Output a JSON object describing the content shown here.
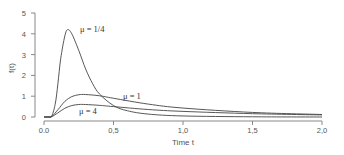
{
  "chart_data": {
    "type": "line",
    "title": "",
    "xlabel": "Time t",
    "ylabel": "f(t)",
    "xlim": [
      0,
      2
    ],
    "ylim": [
      0,
      5
    ],
    "xticks": [
      "0.0",
      "0.5",
      "1.0",
      "1.5",
      "2.0"
    ],
    "xtick_labels": [
      "0.0",
      "0,5",
      "1,0",
      "1,5",
      "2,0"
    ],
    "yticks": [
      "0",
      "1",
      "2",
      "3",
      "4",
      "5"
    ],
    "grid": false,
    "legend": "none (inline annotations)",
    "series": [
      {
        "name": "μ = 1/4",
        "x": [
          0.0,
          0.05,
          0.08,
          0.1,
          0.12,
          0.15,
          0.17,
          0.2,
          0.25,
          0.3,
          0.35,
          0.4,
          0.5,
          0.6,
          0.75,
          1.0,
          1.5,
          2.0
        ],
        "y": [
          0.0,
          0.0,
          0.6,
          1.6,
          2.8,
          3.9,
          4.2,
          4.0,
          3.2,
          2.3,
          1.6,
          1.1,
          0.55,
          0.3,
          0.14,
          0.05,
          0.01,
          0.0
        ]
      },
      {
        "name": "μ = 1",
        "x": [
          0.0,
          0.05,
          0.1,
          0.15,
          0.2,
          0.25,
          0.3,
          0.4,
          0.5,
          0.75,
          1.0,
          1.5,
          2.0
        ],
        "y": [
          0.0,
          0.0,
          0.35,
          0.75,
          0.98,
          1.07,
          1.08,
          1.02,
          0.9,
          0.62,
          0.43,
          0.22,
          0.12
        ]
      },
      {
        "name": "μ = 4",
        "x": [
          0.0,
          0.05,
          0.1,
          0.15,
          0.2,
          0.25,
          0.3,
          0.4,
          0.5,
          0.75,
          1.0,
          1.5,
          2.0
        ],
        "y": [
          0.0,
          0.0,
          0.2,
          0.42,
          0.55,
          0.6,
          0.6,
          0.56,
          0.5,
          0.36,
          0.27,
          0.16,
          0.1
        ]
      }
    ],
    "annotations": [
      {
        "text": "μ = 1/4",
        "x": 0.3,
        "y": 4.1
      },
      {
        "text": "μ = 1",
        "x": 0.58,
        "y": 1.05
      },
      {
        "text": "μ = 4",
        "x": 0.26,
        "y": 0.35
      }
    ]
  },
  "labels": {
    "xlabel": "Time t",
    "ylabel": "f(t)",
    "ann_quarter": "μ = 1/4",
    "ann_one": "μ = 1",
    "ann_four": "μ = 4"
  }
}
